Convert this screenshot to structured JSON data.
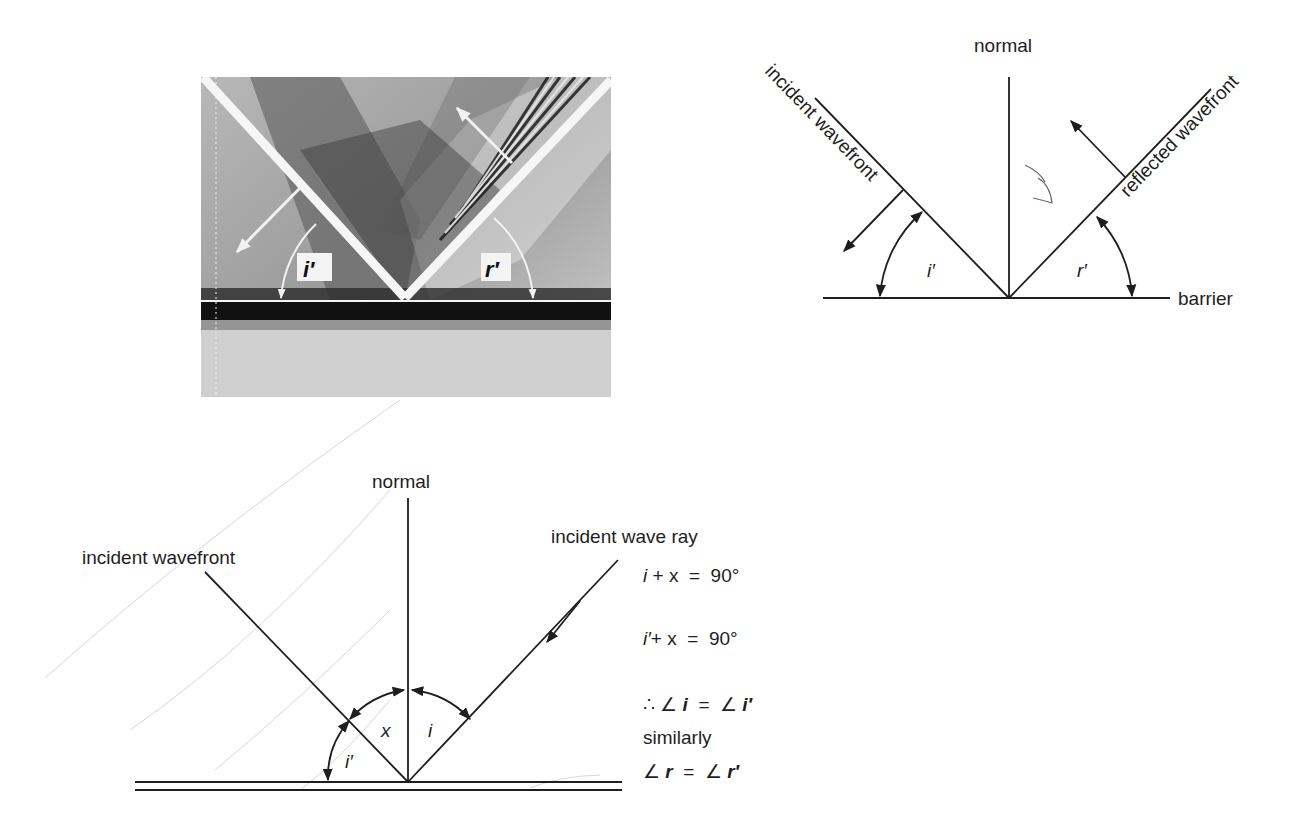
{
  "figure": {
    "photo": {
      "label_incident": "i′",
      "label_reflected": "r′",
      "colors": {
        "dark": "#1a1a1a",
        "mid": "#8a8a8a",
        "light": "#d8d8d8",
        "crest": "#f4f4f4"
      }
    },
    "top_diagram": {
      "normal_label": "normal",
      "incident_label": "incident wavefront",
      "reflected_label": "reflected wavefront",
      "barrier_label": "barrier",
      "angle_incident": "i′",
      "angle_reflected": "r′"
    },
    "bottom_diagram": {
      "normal_label": "normal",
      "incident_wavefront_label": "incident wavefront",
      "incident_ray_label": "incident wave ray",
      "angle_x": "x",
      "angle_i": "i",
      "angle_i_prime": "i′",
      "equations": [
        {
          "lhs_var": "i",
          "rest": " + x  =  90°"
        },
        {
          "lhs_var": "i′",
          "rest": "+ x  =  90°"
        }
      ],
      "conclusion": {
        "prefix": "∴ ∠ ",
        "var1": "i",
        "mid": "  =  ∠ ",
        "var2": "i′"
      },
      "similarly_label": "similarly",
      "similar": {
        "prefix": "∠ ",
        "var1": "r",
        "mid": "  =  ∠ ",
        "var2": "r′"
      }
    }
  }
}
